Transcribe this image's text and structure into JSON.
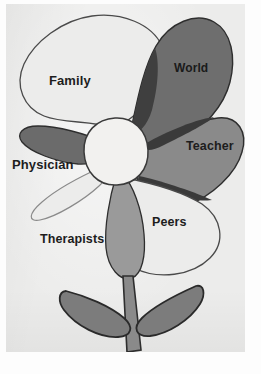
{
  "figure": {
    "kind": "flower-diagram",
    "background_color": "#ececeb",
    "outline_color": "#3a3a3a",
    "label_color": "#1d1d1d",
    "center": {
      "name": "flower-center",
      "fill": "#f2f1ef"
    },
    "petals": [
      {
        "id": "family",
        "label": "Family",
        "fill": "#ececeb",
        "filled": false,
        "position": "upper-left"
      },
      {
        "id": "world",
        "label": "World",
        "fill": "#6e6e6e",
        "shade": "#3f3f3f",
        "filled": true,
        "position": "upper-right"
      },
      {
        "id": "teacher",
        "label": "Teacher",
        "fill": "#8a8a8a",
        "shade": "#3f3f3f",
        "filled": true,
        "position": "right"
      },
      {
        "id": "physician",
        "label": "Physician",
        "fill": "#6b6b6b",
        "filled": true,
        "position": "left"
      },
      {
        "id": "therapists",
        "label": "Therapists",
        "fill": "#ececeb",
        "filled": false,
        "position": "lower-left"
      },
      {
        "id": "peers",
        "label": "Peers",
        "fill": "#ececeb",
        "filled": false,
        "position": "lower-right"
      }
    ],
    "stem": {
      "name": "stem",
      "fill": "#8a8a8a"
    },
    "leaves": [
      {
        "id": "leaf-left",
        "fill": "#7c7c7c"
      },
      {
        "id": "leaf-right",
        "fill": "#7c7c7c"
      }
    ],
    "inner_petal": {
      "id": "inner-petal-lower",
      "fill": "#9a9a9a"
    }
  }
}
